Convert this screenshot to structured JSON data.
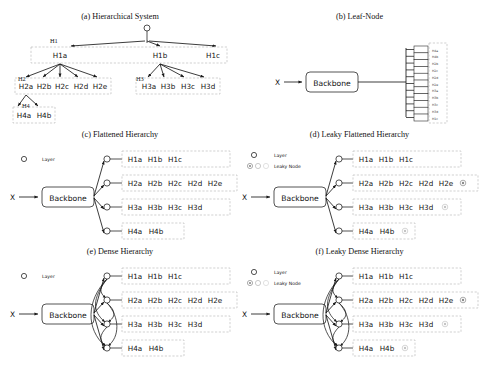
{
  "figure": {
    "panels": [
      {
        "id": "a",
        "caption": "(a) Hierarchical System",
        "level_labels": [
          "H1",
          "H2",
          "H3",
          "H4"
        ],
        "rows": [
          {
            "name": "H1",
            "nodes": [
              "H1a",
              "H1b",
              "H1c"
            ]
          },
          {
            "name": "H2",
            "nodes": [
              "H2a",
              "H2b",
              "H2c",
              "H2d",
              "H2e"
            ]
          },
          {
            "name": "H3",
            "nodes": [
              "H3a",
              "H3b",
              "H3c",
              "H3d"
            ]
          },
          {
            "name": "H4",
            "nodes": [
              "H4a",
              "H4b"
            ]
          }
        ],
        "root_icon": "root-circle-node"
      },
      {
        "id": "b",
        "caption": "(b) Leaf-Node",
        "input_label": "X",
        "backbone_label": "Backbone",
        "leaves": [
          "H4a",
          "H4b",
          "H2b",
          "H2c",
          "H2d",
          "H2e",
          "H3a",
          "H3b",
          "H3c",
          "H3d",
          "H1c"
        ]
      },
      {
        "id": "c",
        "caption": "(c) Flattened Hierarchy",
        "input_label": "X",
        "backbone_label": "Backbone",
        "legend": [
          {
            "marker": "layer-node",
            "label": "Layer"
          }
        ],
        "rows": [
          {
            "nodes": [
              "H1a",
              "H1b",
              "H1c"
            ],
            "leaky": 0
          },
          {
            "nodes": [
              "H2a",
              "H2b",
              "H2c",
              "H2d",
              "H2e"
            ],
            "leaky": 0
          },
          {
            "nodes": [
              "H3a",
              "H3b",
              "H3c",
              "H3d"
            ],
            "leaky": 0
          },
          {
            "nodes": [
              "H4a",
              "H4b"
            ],
            "leaky": 0
          }
        ]
      },
      {
        "id": "d",
        "caption": "(d) Leaky Flattened Hierarchy",
        "input_label": "X",
        "backbone_label": "Backbone",
        "legend": [
          {
            "marker": "layer-node",
            "label": "Layer"
          },
          {
            "marker": "leaky-node",
            "label": "Leaky Node"
          }
        ],
        "rows": [
          {
            "nodes": [
              "H1a",
              "H1b",
              "H1c"
            ],
            "leaky": 0
          },
          {
            "nodes": [
              "H2a",
              "H2b",
              "H2c",
              "H2d",
              "H2e"
            ],
            "leaky": 1
          },
          {
            "nodes": [
              "H3a",
              "H3b",
              "H3c",
              "H3d"
            ],
            "leaky": 1
          },
          {
            "nodes": [
              "H4a",
              "H4b"
            ],
            "leaky": 1
          }
        ]
      },
      {
        "id": "e",
        "caption": "(e) Dense Hierarchy",
        "input_label": "X",
        "backbone_label": "Backbone",
        "legend": [
          {
            "marker": "layer-node",
            "label": "Layer"
          }
        ],
        "rows": [
          {
            "nodes": [
              "H1a",
              "H1b",
              "H1c"
            ],
            "leaky": 0
          },
          {
            "nodes": [
              "H2a",
              "H2b",
              "H2c",
              "H2d",
              "H2e"
            ],
            "leaky": 0
          },
          {
            "nodes": [
              "H3a",
              "H3b",
              "H3c",
              "H3d"
            ],
            "leaky": 0
          },
          {
            "nodes": [
              "H4a",
              "H4b"
            ],
            "leaky": 0
          }
        ]
      },
      {
        "id": "f",
        "caption": "(f) Leaky Dense Hierarchy",
        "input_label": "X",
        "backbone_label": "Backbone",
        "legend": [
          {
            "marker": "layer-node",
            "label": "Layer"
          },
          {
            "marker": "leaky-node",
            "label": "Leaky Node"
          }
        ],
        "rows": [
          {
            "nodes": [
              "H1a",
              "H1b",
              "H1c"
            ],
            "leaky": 0
          },
          {
            "nodes": [
              "H2a",
              "H2b",
              "H2c",
              "H2d",
              "H2e"
            ],
            "leaky": 1
          },
          {
            "nodes": [
              "H3a",
              "H3b",
              "H3c",
              "H3d"
            ],
            "leaky": 1
          },
          {
            "nodes": [
              "H4a",
              "H4b"
            ],
            "leaky": 1
          }
        ]
      }
    ],
    "colors": {
      "line": "#1a1a1a",
      "group_border": "#b4b4b4",
      "leaky_node": "#9b9b9b",
      "background": "#ffffff"
    }
  }
}
